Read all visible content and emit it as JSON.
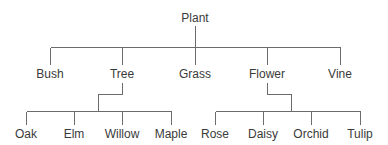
{
  "diagram": {
    "type": "tree",
    "root": {
      "label": "Plant",
      "children": [
        {
          "label": "Bush"
        },
        {
          "label": "Tree",
          "children": [
            {
              "label": "Oak"
            },
            {
              "label": "Elm"
            },
            {
              "label": "Willow"
            },
            {
              "label": "Maple"
            }
          ]
        },
        {
          "label": "Grass"
        },
        {
          "label": "Flower",
          "children": [
            {
              "label": "Rose"
            },
            {
              "label": "Daisy"
            },
            {
              "label": "Orchid"
            },
            {
              "label": "Tulip"
            }
          ]
        },
        {
          "label": "Vine"
        }
      ]
    },
    "colors": {
      "line": "#6b6b6b",
      "text": "#3a3a3a",
      "background": "#ffffff"
    }
  }
}
